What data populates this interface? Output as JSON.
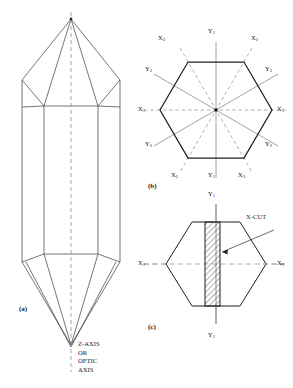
{
  "figure": {
    "panels": [
      {
        "id": "(a)",
        "name": "quartz-crystal-perspective"
      },
      {
        "id": "(b)",
        "name": "hexagonal-cross-section-axes"
      },
      {
        "id": "(c)",
        "name": "x-cut-slab-diagram"
      }
    ]
  },
  "panel_a": {
    "id": "(a)",
    "axis_caption": "Z-AXIS\nOR\nOPTIC\nAXIS",
    "axis_caption_lines": [
      "Z-AXIS",
      "OR",
      "OPTIC",
      "AXIS"
    ]
  },
  "panel_b": {
    "id": "(b)",
    "labels": {
      "top_y1": "Y",
      "top_y1_sub": "1",
      "top_left_x3": "X",
      "top_left_x3_sub": "3",
      "top_right_x2": "X",
      "top_right_x2_sub": "2",
      "upper_left_y2": "Y",
      "upper_left_y2_sub": "2",
      "upper_right_y3": "Y",
      "upper_right_y3_sub": "3",
      "left_x1": "X",
      "left_x1_sub": "1",
      "right_x1": "X",
      "right_x1_sub": "1",
      "lower_left_y3": "Y",
      "lower_left_y3_sub": "3",
      "lower_right_y2": "Y",
      "lower_right_y2_sub": "2",
      "bottom_left_x2": "X",
      "bottom_left_x2_sub": "2",
      "bottom_right_x3": "X",
      "bottom_right_x3_sub": "3",
      "bottom_y1": "Y",
      "bottom_y1_sub": "1"
    }
  },
  "panel_c": {
    "id": "(c)",
    "labels": {
      "top_y1": "Y",
      "top_y1_sub": "1",
      "bottom_y1": "Y",
      "bottom_y1_sub": "1",
      "left_x1": "X",
      "left_x1_sub": "1",
      "right_x1": "X",
      "right_x1_sub": "1",
      "callout": "X-CUT"
    }
  },
  "colors": {
    "stroke": "#2b2b2b",
    "dashed_axis": "#8d8d8d",
    "solid_axis": "#8d8d8d",
    "hatch": "#3a3a3a",
    "background": "#ffffff"
  }
}
